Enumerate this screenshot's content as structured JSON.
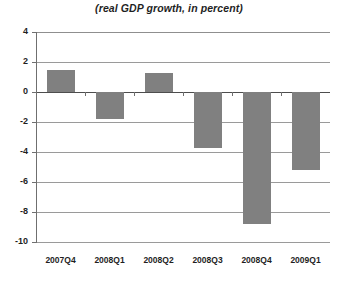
{
  "chart_data": {
    "type": "bar",
    "title": "(real GDP growth, in percent)",
    "xlabel": "",
    "ylabel": "",
    "categories": [
      "2007Q4",
      "2008Q1",
      "2008Q2",
      "2008Q3",
      "2008Q4",
      "2009Q1"
    ],
    "values": [
      1.5,
      -1.8,
      1.3,
      -3.7,
      -8.8,
      -5.2
    ],
    "ylim": [
      -10,
      4
    ],
    "ytick_step": 2,
    "yticks": [
      4,
      2,
      0,
      -2,
      -4,
      -6,
      -8,
      -10
    ],
    "ytick_labels": [
      "4",
      "2",
      "0",
      "-2",
      "-4",
      "-6",
      "-8",
      "-10"
    ],
    "grid": true,
    "grid_axis": "y",
    "legend": false,
    "bar_color": "#808080",
    "gridline_color": "#9a9a9a",
    "zero_line_color": "#4d4d4d",
    "axis_color": "#6f6f6f",
    "background_color": "#ffffff",
    "text_color": "#1f1f1f"
  }
}
